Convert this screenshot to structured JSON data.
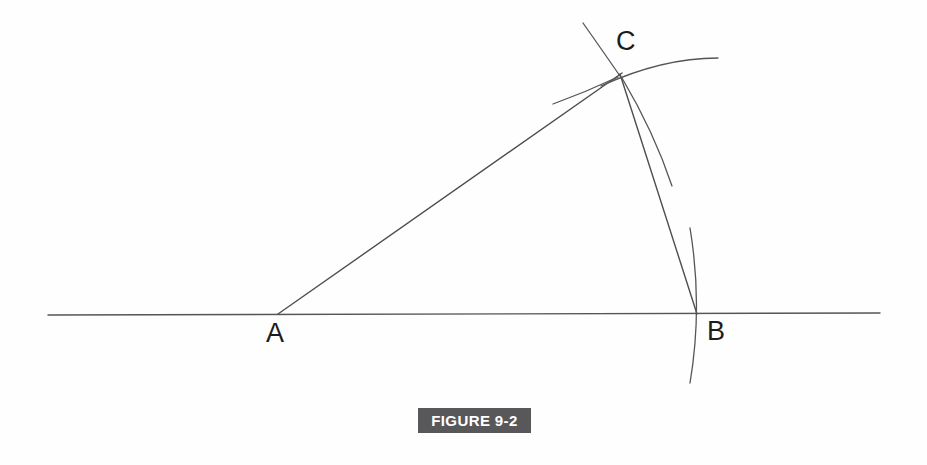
{
  "figure": {
    "caption": "FIGURE 9-2",
    "caption_banner_color": "#58585a",
    "caption_text_color": "#ffffff",
    "background_color": "#fefefe",
    "ink_color": "#4a4a4a",
    "label_color": "#1c1c1c"
  },
  "labels": {
    "point_a": "A",
    "point_b": "B",
    "point_c": "C"
  },
  "geometry": {
    "description": "Compass-and-straightedge angle construction",
    "points": [
      {
        "name": "A",
        "x": 278,
        "y": 314
      },
      {
        "name": "B",
        "x": 697,
        "y": 314
      },
      {
        "name": "C",
        "x": 620,
        "y": 75
      }
    ],
    "baseline": {
      "name": "horizontal-baseline",
      "x1": 48,
      "y1": 315,
      "x2": 880,
      "y2": 313
    },
    "segments": [
      {
        "name": "segment-ac",
        "x1": 278,
        "y1": 314,
        "x2": 622,
        "y2": 73
      },
      {
        "name": "segment-cb",
        "x1": 620,
        "y1": 74,
        "x2": 697,
        "y2": 314
      }
    ],
    "construction_arcs": [
      {
        "name": "arc-through-c-upper-right",
        "d": "M 601 86 Q 662 58 718 58"
      },
      {
        "name": "arc-left-of-c",
        "d": "M 553 104 Q 586 92 618 77"
      },
      {
        "name": "arc-below-c",
        "d": "M 622 78 Q 654 132 672 186"
      },
      {
        "name": "arc-through-b",
        "d": "M 690 228 Q 702 306 690 383"
      },
      {
        "name": "arc-above-c",
        "d": "M 583 23 Q 602 50 620 76"
      }
    ]
  }
}
